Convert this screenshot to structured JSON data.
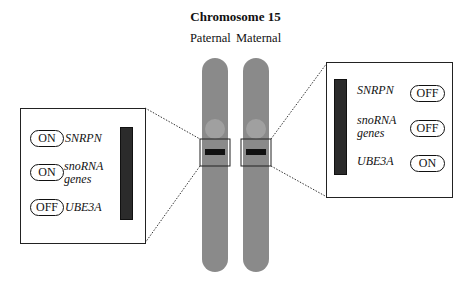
{
  "title": "Chromosome 15",
  "labels": {
    "paternal": "Paternal",
    "maternal": "Maternal"
  },
  "colors": {
    "chromosome": "#8a8a8a",
    "band": "#111111",
    "box_bar": "#2b2b2b"
  },
  "paternal_panel": {
    "genes": [
      {
        "name": "SNRPN",
        "state": "ON"
      },
      {
        "name_line1": "snoRNA",
        "name_line2": "genes",
        "state": "ON"
      },
      {
        "name": "UBE3A",
        "state": "OFF"
      }
    ]
  },
  "maternal_panel": {
    "genes": [
      {
        "name": "SNRPN",
        "state": "OFF"
      },
      {
        "name_line1": "snoRNA",
        "name_line2": "genes",
        "state": "OFF"
      },
      {
        "name": "UBE3A",
        "state": "ON"
      }
    ]
  }
}
